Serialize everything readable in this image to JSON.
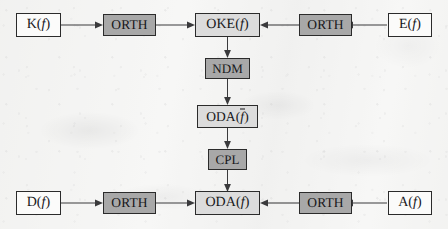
{
  "figure": {
    "kind": "block-diagram",
    "background_color": "#f7f7f6",
    "box_fill_plain": "#fbfbfa",
    "box_fill_light": "#dcdcdc",
    "box_fill_dark": "#a8a8a8",
    "line_color": "#3a3a3c",
    "text_color": "#17171a"
  },
  "nodes": {
    "k_input": {
      "label_main": "K",
      "label_arg": "f",
      "label_full": "K(f)"
    },
    "orth_top_left": {
      "label_main": "ORTH",
      "label_full": "ORTH"
    },
    "oke": {
      "label_main": "OKE",
      "label_arg": "f",
      "label_full": "OKE(f)"
    },
    "orth_top_right": {
      "label_main": "ORTH",
      "label_full": "ORTH"
    },
    "e_input": {
      "label_main": "E",
      "label_arg": "f",
      "label_full": "E(f)"
    },
    "ndm": {
      "label_main": "NDM",
      "label_full": "NDM"
    },
    "oda_bar": {
      "label_main": "ODA",
      "label_arg": "f",
      "label_full": "ODA(f̄)",
      "arg_overbar": true
    },
    "cpl": {
      "label_main": "CPL",
      "label_full": "CPL"
    },
    "d_input": {
      "label_main": "D",
      "label_arg": "f",
      "label_full": "D(f)"
    },
    "orth_bot_left": {
      "label_main": "ORTH",
      "label_full": "ORTH"
    },
    "oda": {
      "label_main": "ODA",
      "label_arg": "f",
      "label_full": "ODA(f)"
    },
    "orth_bot_right": {
      "label_main": "ORTH",
      "label_full": "ORTH"
    },
    "a_input": {
      "label_main": "A",
      "label_arg": "f",
      "label_full": "A(f)"
    }
  },
  "edges": [
    {
      "from": "k_input",
      "to": "orth_top_left",
      "direction": "right"
    },
    {
      "from": "orth_top_left",
      "to": "oke",
      "direction": "right"
    },
    {
      "from": "e_input",
      "to": "orth_top_right",
      "direction": "left"
    },
    {
      "from": "orth_top_right",
      "to": "oke",
      "direction": "left"
    },
    {
      "from": "oke",
      "to": "ndm",
      "direction": "down"
    },
    {
      "from": "ndm",
      "to": "oda_bar",
      "direction": "down"
    },
    {
      "from": "oda_bar",
      "to": "cpl",
      "direction": "down"
    },
    {
      "from": "cpl",
      "to": "oda",
      "direction": "down"
    },
    {
      "from": "d_input",
      "to": "orth_bot_left",
      "direction": "right"
    },
    {
      "from": "orth_bot_left",
      "to": "oda",
      "direction": "right"
    },
    {
      "from": "a_input",
      "to": "orth_bot_right",
      "direction": "left"
    },
    {
      "from": "orth_bot_right",
      "to": "oda",
      "direction": "left"
    }
  ]
}
